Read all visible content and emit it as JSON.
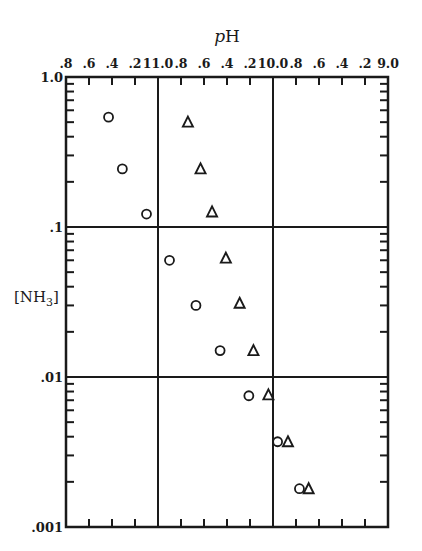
{
  "chart_data": {
    "type": "scatter",
    "title": "",
    "xlabel": "pH",
    "ylabel": "[NH3]",
    "ylabel_text": "[NH",
    "ylabel_sub": "3",
    "ylabel_close": "]",
    "xlabel_italic": "p",
    "xlabel_rest": "H",
    "x_axis_position": "top",
    "xlim": [
      11.8,
      9.0
    ],
    "x_reversed": true,
    "y_scale": "log",
    "ylim": [
      0.001,
      1.0
    ],
    "grid": "major lines at pH 11.0, 10.0 and [NH3] 0.1, 0.01",
    "x_grid": [
      11.0,
      10.0
    ],
    "y_grid": [
      0.1,
      0.01
    ],
    "x_ticks": [
      11.8,
      11.6,
      11.4,
      11.2,
      11.0,
      10.8,
      10.6,
      10.4,
      10.2,
      10.0,
      9.8,
      9.6,
      9.4,
      9.2,
      9.0
    ],
    "x_tick_labels": [
      ".8",
      ".6",
      ".4",
      ".2",
      "11.0",
      ".8",
      ".6",
      ".4",
      ".2",
      "10.0",
      ".8",
      ".6",
      ".4",
      ".2",
      "9.0"
    ],
    "y_ticks": [
      1.0,
      0.1,
      0.01,
      0.001
    ],
    "y_tick_labels": [
      "1.0",
      ".1",
      ".01",
      ".001"
    ],
    "series": [
      {
        "name": "circles",
        "marker": "circle",
        "x": [
          11.43,
          11.31,
          11.1,
          10.9,
          10.67,
          10.46,
          10.21,
          9.96,
          9.77
        ],
        "y": [
          0.54,
          0.244,
          0.122,
          0.06,
          0.03,
          0.015,
          0.0075,
          0.0037,
          0.0018
        ]
      },
      {
        "name": "triangles",
        "marker": "triangle",
        "x": [
          10.74,
          10.63,
          10.53,
          10.41,
          10.29,
          10.17,
          10.04,
          9.87,
          9.69
        ],
        "y": [
          0.5,
          0.244,
          0.126,
          0.062,
          0.031,
          0.015,
          0.0076,
          0.0037,
          0.0018
        ]
      }
    ],
    "legend": "none"
  }
}
